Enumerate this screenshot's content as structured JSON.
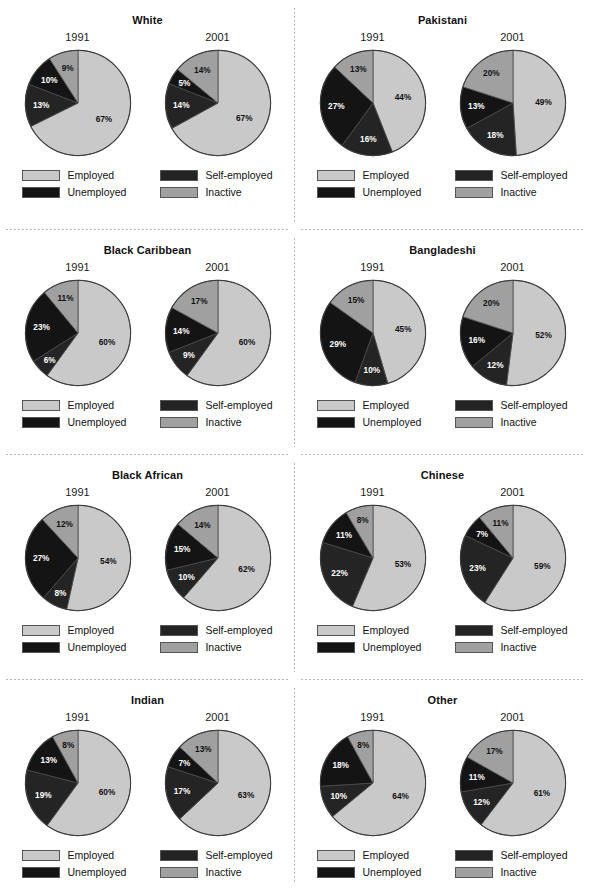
{
  "legend": {
    "items": [
      {
        "label": "Employed",
        "key": "employed",
        "color": "#c9c9c9"
      },
      {
        "label": "Self-employed",
        "key": "self_employed",
        "color": "#242424"
      },
      {
        "label": "Unemployed",
        "key": "unemployed",
        "color": "#141414"
      },
      {
        "label": "Inactive",
        "key": "inactive",
        "color": "#a0a0a0"
      }
    ]
  },
  "years": [
    "1991",
    "2001"
  ],
  "chart_data": {
    "type": "pie",
    "categories": [
      "Employed",
      "Self-employed",
      "Unemployed",
      "Inactive"
    ],
    "colors": [
      "#c9c9c9",
      "#242424",
      "#141414",
      "#a0a0a0"
    ],
    "value_suffix": "%",
    "panels": [
      {
        "title": "White",
        "charts": [
          {
            "year": "1991",
            "values": [
              67,
              13,
              10,
              9
            ],
            "labels": [
              "67%",
              "13%",
              "10%",
              "9%"
            ]
          },
          {
            "year": "2001",
            "values": [
              67,
              14,
              5,
              14
            ],
            "labels": [
              "67%",
              "14%",
              "5%",
              "14%"
            ]
          }
        ]
      },
      {
        "title": "Pakistani",
        "charts": [
          {
            "year": "1991",
            "values": [
              44,
              16,
              27,
              13
            ],
            "labels": [
              "44%",
              "16%",
              "27%",
              "13%"
            ]
          },
          {
            "year": "2001",
            "values": [
              49,
              18,
              13,
              20
            ],
            "labels": [
              "49%",
              "18%",
              "13%",
              "20%"
            ]
          }
        ]
      },
      {
        "title": "Black Caribbean",
        "charts": [
          {
            "year": "1991",
            "values": [
              60,
              6,
              23,
              11
            ],
            "labels": [
              "60%",
              "6%",
              "23%",
              "11%"
            ]
          },
          {
            "year": "2001",
            "values": [
              60,
              9,
              14,
              17
            ],
            "labels": [
              "60%",
              "9%",
              "14%",
              "17%"
            ]
          }
        ]
      },
      {
        "title": "Bangladeshi",
        "charts": [
          {
            "year": "1991",
            "values": [
              45,
              10,
              29,
              15
            ],
            "labels": [
              "45%",
              "10%",
              "29%",
              "15%"
            ]
          },
          {
            "year": "2001",
            "values": [
              52,
              12,
              16,
              20
            ],
            "labels": [
              "52%",
              "12%",
              "16%",
              "20%"
            ]
          }
        ]
      },
      {
        "title": "Black African",
        "charts": [
          {
            "year": "1991",
            "values": [
              54,
              8,
              27,
              12
            ],
            "labels": [
              "54%",
              "8%",
              "27%",
              "12%"
            ]
          },
          {
            "year": "2001",
            "values": [
              62,
              10,
              15,
              14
            ],
            "labels": [
              "62%",
              "10%",
              "15%",
              "14%"
            ]
          }
        ]
      },
      {
        "title": "Chinese",
        "charts": [
          {
            "year": "1991",
            "values": [
              53,
              22,
              11,
              8
            ],
            "labels": [
              "53%",
              "22%",
              "11%",
              "8%"
            ]
          },
          {
            "year": "2001",
            "values": [
              59,
              23,
              7,
              11
            ],
            "labels": [
              "59%",
              "23%",
              "7%",
              "11%"
            ]
          }
        ]
      },
      {
        "title": "Indian",
        "charts": [
          {
            "year": "1991",
            "values": [
              60,
              19,
              13,
              8
            ],
            "labels": [
              "60%",
              "19%",
              "13%",
              "8%"
            ]
          },
          {
            "year": "2001",
            "values": [
              63,
              17,
              7,
              13
            ],
            "labels": [
              "63%",
              "17%",
              "7%",
              "13%"
            ]
          }
        ]
      },
      {
        "title": "Other",
        "charts": [
          {
            "year": "1991",
            "values": [
              64,
              10,
              18,
              8
            ],
            "labels": [
              "64%",
              "10%",
              "18%",
              "8%"
            ]
          },
          {
            "year": "2001",
            "values": [
              61,
              12,
              11,
              17
            ],
            "labels": [
              "61%",
              "12%",
              "11%",
              "17%"
            ]
          }
        ]
      }
    ]
  }
}
